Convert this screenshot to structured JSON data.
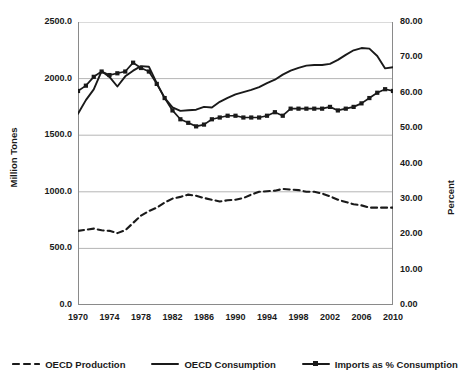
{
  "chart_data": {
    "type": "line",
    "title": "",
    "xlabel": "",
    "ylabel": "Million Tones",
    "y2label": "Percent",
    "xlim": [
      1970,
      2010
    ],
    "ylim": [
      0.0,
      2500.0
    ],
    "y2lim": [
      0.0,
      80.0
    ],
    "grid": true,
    "legend_position": "bottom",
    "x_tick_labels": [
      "1970",
      "1974",
      "1978",
      "1982",
      "1986",
      "1990",
      "1994",
      "1998",
      "2002",
      "2006",
      "2010"
    ],
    "x_tick_values": [
      1970,
      1974,
      1978,
      1982,
      1986,
      1990,
      1994,
      1998,
      2002,
      2006,
      2010
    ],
    "y_tick_labels": [
      "0.0",
      "500.0",
      "1000.0",
      "1500.0",
      "2000.0",
      "2500.0"
    ],
    "y_tick_values": [
      0,
      500,
      1000,
      1500,
      2000,
      2500
    ],
    "y2_tick_labels": [
      "0.00",
      "10.00",
      "20.00",
      "30.00",
      "40.00",
      "50.00",
      "60.00",
      "70.00",
      "80.00"
    ],
    "y2_tick_values": [
      0,
      10,
      20,
      30,
      40,
      50,
      60,
      70,
      80
    ],
    "x": [
      1970,
      1971,
      1972,
      1973,
      1974,
      1975,
      1976,
      1977,
      1978,
      1979,
      1980,
      1981,
      1982,
      1983,
      1984,
      1985,
      1986,
      1987,
      1988,
      1989,
      1990,
      1991,
      1992,
      1993,
      1994,
      1995,
      1996,
      1997,
      1998,
      1999,
      2000,
      2001,
      2002,
      2003,
      2004,
      2005,
      2006,
      2007,
      2008,
      2009,
      2010
    ],
    "series": [
      {
        "name": "OECD Production",
        "axis": "left",
        "style": "dashed",
        "marker": "none",
        "color": "#1a1a1a",
        "values": [
          655,
          665,
          675,
          660,
          655,
          635,
          660,
          725,
          790,
          830,
          860,
          905,
          940,
          955,
          975,
          965,
          945,
          930,
          915,
          925,
          930,
          945,
          975,
          1000,
          1005,
          1010,
          1025,
          1020,
          1015,
          1000,
          1000,
          985,
          960,
          930,
          910,
          890,
          880,
          860,
          860,
          860,
          860
        ]
      },
      {
        "name": "OECD Consumption",
        "axis": "left",
        "style": "solid",
        "marker": "none",
        "color": "#1a1a1a",
        "values": [
          1690,
          1810,
          1905,
          2065,
          2015,
          1930,
          2020,
          2070,
          2110,
          2105,
          1960,
          1830,
          1745,
          1715,
          1720,
          1725,
          1750,
          1745,
          1795,
          1830,
          1860,
          1880,
          1900,
          1925,
          1960,
          1990,
          2035,
          2070,
          2095,
          2115,
          2120,
          2120,
          2130,
          2165,
          2210,
          2250,
          2270,
          2265,
          2200,
          2090,
          2100
        ]
      },
      {
        "name": "Imports as % Consumption",
        "axis": "right",
        "style": "solid",
        "marker": "square",
        "color": "#1a1a1a",
        "values": [
          60.5,
          62.0,
          64.5,
          66.0,
          65.0,
          65.5,
          66.0,
          68.5,
          67.0,
          66.0,
          62.5,
          58.5,
          55.0,
          52.5,
          51.5,
          50.5,
          51.0,
          52.5,
          53.0,
          53.5,
          53.5,
          53.0,
          53.0,
          53.0,
          53.5,
          54.5,
          53.5,
          55.5,
          55.5,
          55.5,
          55.5,
          55.5,
          56.0,
          55.0,
          55.5,
          56.0,
          57.0,
          58.5,
          60.0,
          61.0,
          60.5
        ]
      }
    ]
  },
  "legend": [
    {
      "label": "OECD Production",
      "style": "dashed",
      "marker": "none"
    },
    {
      "label": "OECD Consumption",
      "style": "solid",
      "marker": "none"
    },
    {
      "label": "Imports as % Consumption",
      "style": "solid",
      "marker": "square"
    }
  ]
}
